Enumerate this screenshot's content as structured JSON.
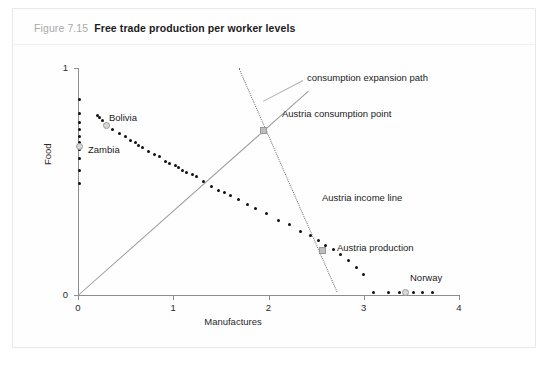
{
  "figure": {
    "number": "Figure 7.15",
    "title": "Free trade production per worker levels"
  },
  "chart_data": {
    "type": "scatter",
    "title": "Free trade production per worker levels",
    "xlabel": "Manufactures",
    "ylabel": "Food",
    "xlim": [
      0,
      4
    ],
    "ylim": [
      0,
      1
    ],
    "xticks": [
      "0",
      "1",
      "2",
      "3",
      "4"
    ],
    "yticks": [
      "0",
      "1"
    ],
    "grid": false,
    "legend": "none",
    "series": [
      {
        "name": "Country production per worker points",
        "marker": "black-dot",
        "points": [
          [
            0.02,
            0.86
          ],
          [
            0.02,
            0.8
          ],
          [
            0.02,
            0.76
          ],
          [
            0.02,
            0.73
          ],
          [
            0.02,
            0.7
          ],
          [
            0.02,
            0.67
          ],
          [
            0.02,
            0.64
          ],
          [
            0.02,
            0.6
          ],
          [
            0.02,
            0.55
          ],
          [
            0.02,
            0.49
          ],
          [
            0.2,
            0.79
          ],
          [
            0.23,
            0.78
          ],
          [
            0.26,
            0.77
          ],
          [
            0.3,
            0.75
          ],
          [
            0.36,
            0.73
          ],
          [
            0.44,
            0.71
          ],
          [
            0.5,
            0.7
          ],
          [
            0.55,
            0.68
          ],
          [
            0.6,
            0.67
          ],
          [
            0.64,
            0.66
          ],
          [
            0.68,
            0.65
          ],
          [
            0.74,
            0.63
          ],
          [
            0.8,
            0.62
          ],
          [
            0.86,
            0.61
          ],
          [
            0.92,
            0.59
          ],
          [
            0.96,
            0.58
          ],
          [
            1.02,
            0.57
          ],
          [
            1.06,
            0.56
          ],
          [
            1.1,
            0.55
          ],
          [
            1.14,
            0.54
          ],
          [
            1.2,
            0.53
          ],
          [
            1.24,
            0.52
          ],
          [
            1.32,
            0.5
          ],
          [
            1.4,
            0.48
          ],
          [
            1.48,
            0.46
          ],
          [
            1.54,
            0.45
          ],
          [
            1.6,
            0.44
          ],
          [
            1.68,
            0.42
          ],
          [
            1.78,
            0.4
          ],
          [
            1.86,
            0.38
          ],
          [
            1.98,
            0.36
          ],
          [
            2.1,
            0.33
          ],
          [
            2.22,
            0.31
          ],
          [
            2.34,
            0.28
          ],
          [
            2.44,
            0.26
          ],
          [
            2.52,
            0.24
          ],
          [
            2.6,
            0.22
          ],
          [
            2.68,
            0.2
          ],
          [
            2.76,
            0.18
          ],
          [
            2.84,
            0.15
          ],
          [
            2.92,
            0.12
          ],
          [
            3.0,
            0.09
          ],
          [
            3.1,
            0.01
          ],
          [
            3.26,
            0.01
          ],
          [
            3.38,
            0.01
          ],
          [
            3.52,
            0.01
          ],
          [
            3.62,
            0.01
          ],
          [
            3.72,
            0.01
          ]
        ]
      }
    ],
    "highlights": [
      {
        "label": "Bolivia",
        "marker": "gray-circle",
        "x": 0.3,
        "y": 0.745
      },
      {
        "label": "Zambia",
        "marker": "gray-circle",
        "x": 0.02,
        "y": 0.655
      },
      {
        "label": "Norway",
        "marker": "gray-circle",
        "x": 3.44,
        "y": 0.01
      },
      {
        "label": "Austria consumption point",
        "marker": "gray-square",
        "x": 1.95,
        "y": 0.725
      },
      {
        "label": "Austria production",
        "marker": "gray-square",
        "x": 2.57,
        "y": 0.195
      }
    ],
    "annotations": [
      {
        "text": "consumption expansion path",
        "type": "line-label",
        "leader": true
      },
      {
        "text": "Austria income line",
        "type": "line-label",
        "leader": false
      },
      {
        "text": "Austria consumption point",
        "type": "point-label",
        "leader": false
      },
      {
        "text": "Austria production",
        "type": "point-label",
        "leader": false
      },
      {
        "text": "Bolivia",
        "type": "point-label",
        "leader": false
      },
      {
        "text": "Zambia",
        "type": "point-label",
        "leader": false
      },
      {
        "text": "Norway",
        "type": "point-label",
        "leader": false
      }
    ],
    "lines": [
      {
        "name": "consumption expansion path",
        "style": "solid",
        "color": "#9c9c9c",
        "from": [
          0,
          0
        ],
        "to": [
          2.42,
          0.9
        ]
      },
      {
        "name": "Austria income line",
        "style": "dotted",
        "color": "#6f6f6f",
        "from": [
          1.69,
          1.0
        ],
        "to": [
          2.72,
          0.015
        ]
      }
    ]
  },
  "labels": {
    "consumption_expansion_path": "consumption expansion path",
    "austria_consumption_point": "Austria consumption point",
    "austria_income_line": "Austria income line",
    "austria_production": "Austria production",
    "bolivia": "Bolivia",
    "zambia": "Zambia",
    "norway": "Norway"
  },
  "colors": {
    "point": "#111111",
    "axis": "#8d8d8d",
    "ray": "#9c9c9c",
    "dotted": "#6f6f6f",
    "marker_fill": "#d9d9d9",
    "fignum": "#a9a9a9",
    "title": "#1b1b1b"
  }
}
